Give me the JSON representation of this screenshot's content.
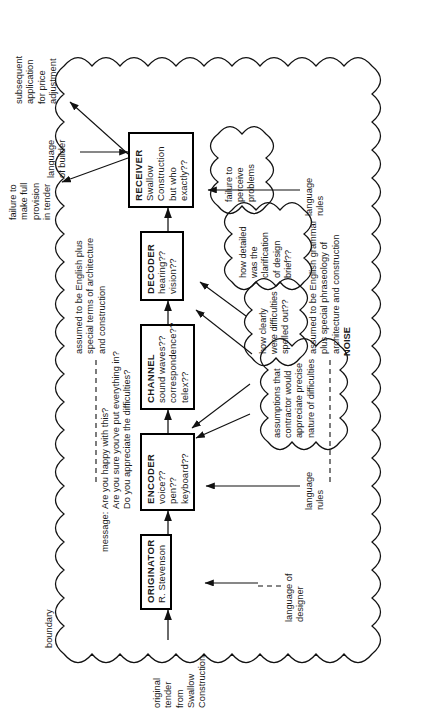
{
  "diagram": {
    "boundary_label": "boundary",
    "noise_label": "NOISE"
  },
  "boxes": [
    {
      "id": "originator",
      "title": "ORIGINATOR",
      "lines": [
        "R. Stevenson"
      ]
    },
    {
      "id": "encoder",
      "title": "ENCODER",
      "lines": [
        "voice??",
        "pen??",
        "keyboard??"
      ]
    },
    {
      "id": "channel",
      "title": "CHANNEL",
      "lines": [
        "sound waves??",
        "correspondence??",
        "telex??"
      ]
    },
    {
      "id": "decoder",
      "title": "DECODER",
      "lines": [
        "hearing??",
        "vision??"
      ]
    },
    {
      "id": "receiver",
      "title": "RECEIVER",
      "lines": [
        "Swallow",
        "Construction",
        "but who",
        "exactly??"
      ]
    }
  ],
  "annotations": {
    "input_tender": "original\ntender\nfrom\nSwallow\nConstruction",
    "language_of_designer": "language of\ndesigner",
    "language_rules_bottom_left": "language\nrules",
    "language_of_builder": "language\nof builder",
    "language_rules_right": "language\nrules",
    "assumed_designer_language": "assumed to be English plus\nspecial terms of architecture\nand construction",
    "assumed_builder_language": "assumed to be English grammar\nplus special phraseology of\narchitecture and construction",
    "message_prefix": "message:",
    "message_lines": [
      "Are you happy with this?",
      "Are you sure you've put everything in?",
      "Do you appreciate the difficulties?"
    ],
    "outcome_failure": "failure to\nmake full\nprovision\nin tender",
    "outcome_subsequent": "subsequent\napplication\nfor price\nadjustment"
  },
  "noise_clouds": [
    {
      "id": "noise-assumptions",
      "text": "assumptions that\ncontractor would\nappreciate precise\nnature of difficulties"
    },
    {
      "id": "noise-clarity",
      "text": "how clearly\nwere difficulties\nspelled out??"
    },
    {
      "id": "noise-detail",
      "text": "how detailed\nwas the\nclarification\nof design\nbrief??"
    },
    {
      "id": "noise-perceive",
      "text": "failure to\nperceive\nproblems"
    }
  ],
  "colors": {
    "stroke": "#111111",
    "background": "#ffffff",
    "text": "#1a1a1a"
  }
}
